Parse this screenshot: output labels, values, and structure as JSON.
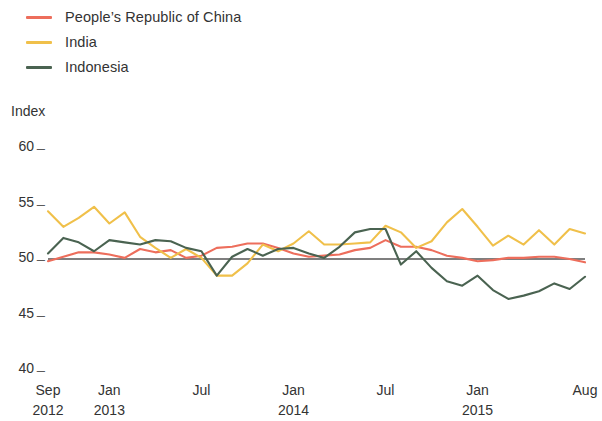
{
  "legend": {
    "position": "top-left",
    "items": [
      {
        "label": "People’s Republic of China",
        "color": "#ED6E5C",
        "key": "china"
      },
      {
        "label": "India",
        "color": "#F0C04A",
        "key": "india"
      },
      {
        "label": "Indonesia",
        "color": "#4A6351",
        "key": "indonesia"
      }
    ]
  },
  "axes": {
    "y_unit_label": "Index",
    "y_ticks": [
      "60",
      "55",
      "50",
      "45",
      "40"
    ],
    "y_tick_dash": "_",
    "x_ticks": [
      {
        "month": "Sep",
        "year": "2012"
      },
      {
        "month": "Jan",
        "year": "2013"
      },
      {
        "month": "Jul",
        "year": ""
      },
      {
        "month": "Jan",
        "year": "2014"
      },
      {
        "month": "Jul",
        "year": ""
      },
      {
        "month": "Jan",
        "year": "2015"
      },
      {
        "month": "Aug",
        "year": ""
      }
    ]
  },
  "reference_line": {
    "value": 50,
    "color": "#555555"
  },
  "chart_data": {
    "type": "line",
    "title": "",
    "subtitle": "",
    "xlabel": "",
    "ylabel": "Index",
    "ylim": [
      40,
      60
    ],
    "yticks": [
      40,
      45,
      50,
      55,
      60
    ],
    "grid": false,
    "legend_position": "top-left",
    "reference_line_y": 50,
    "x": [
      "Sep 2012",
      "Oct 2012",
      "Nov 2012",
      "Dec 2012",
      "Jan 2013",
      "Feb 2013",
      "Mar 2013",
      "Apr 2013",
      "May 2013",
      "Jun 2013",
      "Jul 2013",
      "Aug 2013",
      "Sep 2013",
      "Oct 2013",
      "Nov 2013",
      "Dec 2013",
      "Jan 2014",
      "Feb 2014",
      "Mar 2014",
      "Apr 2014",
      "May 2014",
      "Jun 2014",
      "Jul 2014",
      "Aug 2014",
      "Sep 2014",
      "Oct 2014",
      "Nov 2014",
      "Dec 2014",
      "Jan 2015",
      "Feb 2015",
      "Mar 2015",
      "Apr 2015",
      "May 2015",
      "Jun 2015",
      "Jul 2015",
      "Aug 2015"
    ],
    "series": [
      {
        "name": "People’s Republic of China",
        "color": "#ED6E5C",
        "values": [
          49.8,
          50.2,
          50.6,
          50.6,
          50.4,
          50.1,
          50.9,
          50.6,
          50.8,
          50.1,
          50.3,
          51.0,
          51.1,
          51.4,
          51.4,
          51.0,
          50.5,
          50.2,
          50.3,
          50.4,
          50.8,
          51.0,
          51.7,
          51.1,
          51.1,
          50.8,
          50.3,
          50.1,
          49.8,
          49.9,
          50.1,
          50.1,
          50.2,
          50.2,
          50.0,
          49.7
        ],
        "min": 49.7,
        "max": 51.7
      },
      {
        "name": "India",
        "color": "#F0C04A",
        "values": [
          54.3,
          52.9,
          53.7,
          54.7,
          53.2,
          54.2,
          52.0,
          51.0,
          50.1,
          50.9,
          50.1,
          48.5,
          48.5,
          49.6,
          51.3,
          50.7,
          51.4,
          52.5,
          51.3,
          51.3,
          51.4,
          51.5,
          53.0,
          52.4,
          51.0,
          51.6,
          53.3,
          54.5,
          52.9,
          51.2,
          52.1,
          51.3,
          52.6,
          51.3,
          52.7,
          52.3
        ],
        "min": 48.5,
        "max": 54.7
      },
      {
        "name": "Indonesia",
        "color": "#4A6351",
        "values": [
          50.5,
          51.9,
          51.5,
          50.7,
          51.7,
          51.5,
          51.3,
          51.7,
          51.6,
          51.0,
          50.7,
          48.5,
          50.2,
          50.9,
          50.3,
          50.9,
          51.0,
          50.5,
          50.1,
          51.1,
          52.4,
          52.7,
          52.7,
          49.5,
          50.7,
          49.2,
          48.0,
          47.6,
          48.5,
          47.2,
          46.4,
          46.7,
          47.1,
          47.8,
          47.3,
          48.4
        ],
        "min": 46.4,
        "max": 52.7
      }
    ]
  },
  "plot_geometry": {
    "x_left_px": 48,
    "x_right_px": 585,
    "y_top_value": 60,
    "y_top_px": 148,
    "y_bottom_value": 40,
    "y_bottom_px": 370
  }
}
